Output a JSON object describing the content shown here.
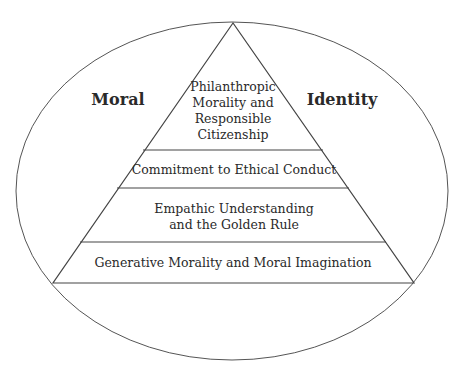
{
  "diagram": {
    "type": "pyramid-in-ellipse",
    "outer_labels": {
      "left": "Moral",
      "right": "Identity"
    },
    "levels": [
      {
        "lines": [
          "Philanthropic",
          "Morality and",
          "Responsible",
          "Citizenship"
        ]
      },
      {
        "lines": [
          "Commitment to Ethical Conduct"
        ]
      },
      {
        "lines": [
          "Empathic Understanding",
          "and the Golden Rule"
        ]
      },
      {
        "lines": [
          "Generative Morality and Moral Imagination"
        ]
      }
    ],
    "colors": {
      "stroke": "#444444",
      "text": "#2a2a2a",
      "background": "#ffffff"
    }
  }
}
